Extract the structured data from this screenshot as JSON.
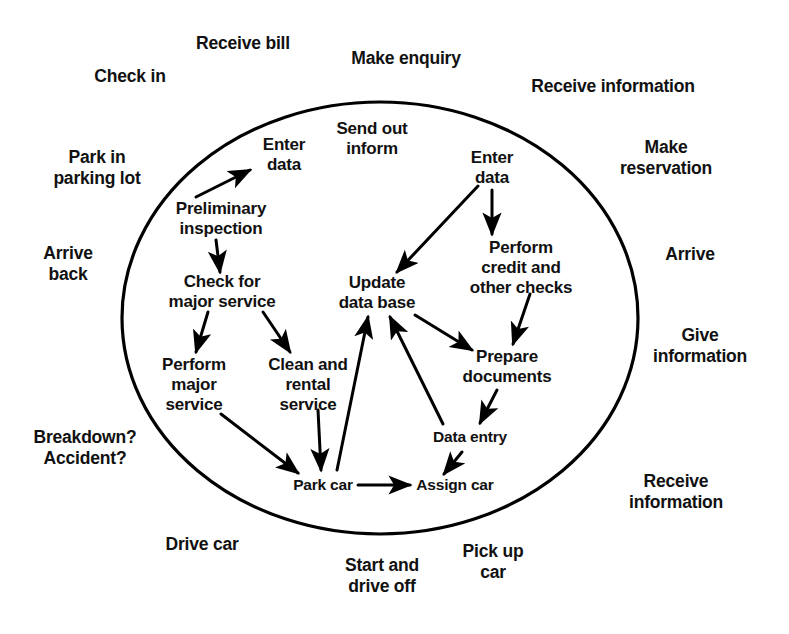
{
  "diagram": {
    "boundary": {
      "shape": "ellipse",
      "name": "system-boundary-ellipse",
      "stroke_color": "#000000",
      "cx": 380,
      "cy": 318,
      "rx": 258,
      "ry": 216
    },
    "outer_labels": [
      {
        "id": "check-in",
        "text": "Check in",
        "x": 130,
        "y": 76,
        "size": "outer"
      },
      {
        "id": "receive-bill",
        "text": "Receive bill",
        "x": 243,
        "y": 43,
        "size": "outer"
      },
      {
        "id": "make-enquiry",
        "text": "Make enquiry",
        "x": 406,
        "y": 58,
        "size": "outer"
      },
      {
        "id": "receive-information-top",
        "text": "Receive information",
        "x": 613,
        "y": 86,
        "size": "outer"
      },
      {
        "id": "park-in-parking-lot",
        "text": "Park in\nparking lot",
        "x": 97,
        "y": 168,
        "size": "outer"
      },
      {
        "id": "make-reservation",
        "text": "Make reservation",
        "x": 666,
        "y": 158,
        "size": "outer"
      },
      {
        "id": "arrive-back",
        "text": "Arrive\nback",
        "x": 68,
        "y": 264,
        "size": "outer"
      },
      {
        "id": "arrive",
        "text": "Arrive",
        "x": 690,
        "y": 254,
        "size": "outer"
      },
      {
        "id": "give-information",
        "text": "Give\ninformation",
        "x": 700,
        "y": 346,
        "size": "outer"
      },
      {
        "id": "breakdown-accident",
        "text": "Breakdown?\nAccident?",
        "x": 85,
        "y": 448,
        "size": "outer"
      },
      {
        "id": "receive-information-bottom",
        "text": "Receive\ninformation",
        "x": 676,
        "y": 492,
        "size": "outer"
      },
      {
        "id": "drive-car",
        "text": "Drive car",
        "x": 202,
        "y": 544,
        "size": "outer"
      },
      {
        "id": "start-and-drive-off",
        "text": "Start and\ndrive off",
        "x": 382,
        "y": 576,
        "size": "outer"
      },
      {
        "id": "pick-up-car",
        "text": "Pick up\ncar",
        "x": 493,
        "y": 562,
        "size": "outer"
      }
    ],
    "nodes": [
      {
        "id": "enter-data-left",
        "text": "Enter\ndata",
        "x": 284,
        "y": 155,
        "size": "inner"
      },
      {
        "id": "send-out-inform",
        "text": "Send out\ninform",
        "x": 372,
        "y": 139,
        "size": "inner"
      },
      {
        "id": "enter-data-right",
        "text": "Enter\ndata",
        "x": 492,
        "y": 168,
        "size": "inner"
      },
      {
        "id": "preliminary-inspection",
        "text": "Preliminary\ninspection",
        "x": 221,
        "y": 219,
        "size": "inner"
      },
      {
        "id": "perform-credit-checks",
        "text": "Perform\ncredit and\nother checks",
        "x": 521,
        "y": 268,
        "size": "inner"
      },
      {
        "id": "check-for-major-service",
        "text": "Check for\nmajor service",
        "x": 222,
        "y": 292,
        "size": "inner"
      },
      {
        "id": "update-data-base",
        "text": "Update\ndata base",
        "x": 377,
        "y": 293,
        "size": "inner"
      },
      {
        "id": "perform-major-service",
        "text": "Perform\nmajor\nservice",
        "x": 194,
        "y": 385,
        "size": "inner"
      },
      {
        "id": "clean-and-rental-service",
        "text": "Clean and\nrental\nservice",
        "x": 308,
        "y": 385,
        "size": "inner"
      },
      {
        "id": "prepare-documents",
        "text": "Prepare\ndocuments",
        "x": 507,
        "y": 367,
        "size": "inner"
      },
      {
        "id": "data-entry",
        "text": "Data entry",
        "x": 470,
        "y": 437,
        "size": "small"
      },
      {
        "id": "park-car",
        "text": "Park car",
        "x": 323,
        "y": 485,
        "size": "small"
      },
      {
        "id": "assign-car",
        "text": "Assign car",
        "x": 455,
        "y": 485,
        "size": "small"
      }
    ],
    "edges": [
      {
        "id": "edge-preliminary-to-enter-data",
        "from": "preliminary-inspection",
        "to": "enter-data-left",
        "path": "M 196 197 L 250 170"
      },
      {
        "id": "edge-preliminary-to-check-major",
        "from": "preliminary-inspection",
        "to": "check-for-major-service",
        "path": "M 216 240 L 220 272"
      },
      {
        "id": "edge-check-major-to-perform-major",
        "from": "check-for-major-service",
        "to": "perform-major-service",
        "path": "M 208 312 L 196 352"
      },
      {
        "id": "edge-check-major-to-clean-rental",
        "from": "check-for-major-service",
        "to": "clean-and-rental-service",
        "path": "M 263 312 L 290 352"
      },
      {
        "id": "edge-perform-major-to-park-car",
        "from": "perform-major-service",
        "to": "park-car",
        "path": "M 221 414 L 298 473"
      },
      {
        "id": "edge-clean-rental-to-park-car",
        "from": "clean-and-rental-service",
        "to": "park-car",
        "path": "M 318 410 L 321 470"
      },
      {
        "id": "edge-enter-data-right-to-update-db",
        "from": "enter-data-right",
        "to": "update-data-base",
        "path": "M 478 186 L 397 272"
      },
      {
        "id": "edge-enter-data-right-to-perform-credit",
        "from": "enter-data-right",
        "to": "perform-credit-checks",
        "path": "M 492 190 L 492 234"
      },
      {
        "id": "edge-perform-credit-to-prepare-docs",
        "from": "perform-credit-checks",
        "to": "prepare-documents",
        "path": "M 530 294 L 513 344"
      },
      {
        "id": "edge-update-db-to-prepare-docs",
        "from": "update-data-base",
        "to": "prepare-documents",
        "path": "M 415 315 L 472 350"
      },
      {
        "id": "edge-prepare-docs-to-data-entry",
        "from": "prepare-documents",
        "to": "data-entry",
        "path": "M 497 390 L 480 423"
      },
      {
        "id": "edge-data-entry-to-assign-car",
        "from": "data-entry",
        "to": "assign-car",
        "path": "M 462 452 L 444 474"
      },
      {
        "id": "edge-park-car-to-assign-car",
        "from": "park-car",
        "to": "assign-car",
        "path": "M 358 485 L 410 485"
      },
      {
        "id": "edge-park-car-to-update-db",
        "from": "park-car",
        "to": "update-data-base",
        "path": "M 337 470 L 368 317"
      },
      {
        "id": "edge-data-entry-to-update-db",
        "from": "data-entry",
        "to": "update-data-base",
        "path": "M 443 424 L 390 317"
      }
    ]
  }
}
